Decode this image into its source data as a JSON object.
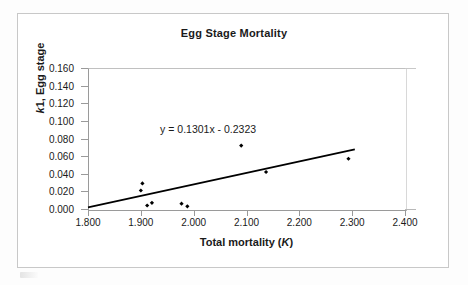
{
  "chart_data": {
    "type": "scatter",
    "title": "Egg Stage Mortality",
    "xlabel": "Total mortality (K)",
    "xlabel_plain": "Total mortality",
    "xlabel_italic": "K",
    "ylabel": "k 1, Egg stage",
    "ylabel_italic": "k",
    "ylabel_plain": "1, Egg stage",
    "xlim": [
      1.8,
      2.4
    ],
    "ylim": [
      0.0,
      0.16
    ],
    "grid": false,
    "legend": false,
    "x_ticks": [
      "1.800",
      "1.900",
      "2.000",
      "2.100",
      "2.200",
      "2.300",
      "2.400"
    ],
    "x_tick_values": [
      1.8,
      1.9,
      2.0,
      2.1,
      2.2,
      2.3,
      2.4
    ],
    "y_ticks": [
      "0.000",
      "0.020",
      "0.040",
      "0.060",
      "0.080",
      "0.100",
      "0.120",
      "0.140",
      "0.160"
    ],
    "y_tick_values": [
      0.0,
      0.02,
      0.04,
      0.06,
      0.08,
      0.1,
      0.12,
      0.14,
      0.16
    ],
    "series": [
      {
        "name": "Egg stage mortality",
        "marker": "filled-diamond",
        "color": "#000000",
        "points": [
          {
            "x": 1.9,
            "y": 0.021
          },
          {
            "x": 1.903,
            "y": 0.029
          },
          {
            "x": 1.912,
            "y": 0.004
          },
          {
            "x": 1.921,
            "y": 0.007
          },
          {
            "x": 1.977,
            "y": 0.006
          },
          {
            "x": 1.988,
            "y": 0.003
          },
          {
            "x": 2.09,
            "y": 0.072
          },
          {
            "x": 2.137,
            "y": 0.042
          },
          {
            "x": 2.293,
            "y": 0.057
          }
        ]
      }
    ],
    "trendline": {
      "equation": "y = 0.1301x - 0.2323",
      "slope": 0.1301,
      "intercept": -0.2323,
      "x_start": 1.8,
      "x_end": 2.305,
      "color": "#000000"
    },
    "annotations": [
      {
        "text": "y = 0.1301x - 0.2323",
        "x": 2.05,
        "y": 0.088
      }
    ]
  },
  "colors": {
    "marker": "#000000",
    "trendline": "#000000",
    "axis": "#9a9a9a",
    "frame": "#c8c8c8",
    "text": "#1a1a1a",
    "background": "#ffffff"
  }
}
